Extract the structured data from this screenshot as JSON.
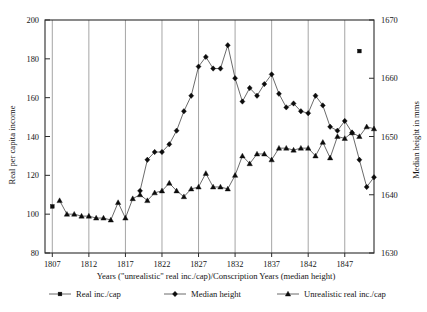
{
  "figure": {
    "background_color": "#ffffff",
    "frame_color": "#2b2b2b",
    "gridline_color": "#8e8e8e",
    "marker_color": "#0c0c0c"
  },
  "axes": {
    "left": {
      "title": "Real per capita income",
      "ticks": [
        "80",
        "100",
        "120",
        "140",
        "160",
        "180",
        "200"
      ],
      "min": 80,
      "max": 200
    },
    "right": {
      "title": "Median height in mms",
      "ticks": [
        "1630",
        "1640",
        "1650",
        "1660",
        "1670"
      ],
      "min": 1630,
      "max": 1670
    },
    "bottom": {
      "title": "Years (\"unrealistic\" real inc./cap)/Conscription Years (median height)",
      "ticks": [
        "1807",
        "1812",
        "1817",
        "1822",
        "1827",
        "1832",
        "1837",
        "1842",
        "1847"
      ],
      "min": 1806,
      "max": 1851
    }
  },
  "legend": {
    "items": [
      {
        "label": "Real inc./cap",
        "marker": "square-marker"
      },
      {
        "label": "Median height",
        "marker": "diamond-marker"
      },
      {
        "label": "Unrealistic real inc./cap",
        "marker": "triangle-marker"
      }
    ]
  },
  "chart_data": {
    "type": "line",
    "title": "",
    "subtitle": "",
    "xlabel": "Years (\"unrealistic\" real inc./cap)/Conscription Years (median height)",
    "ylabel": "Real per capita income",
    "ylabel_right": "Median height in mms",
    "xlim": [
      1806,
      1851
    ],
    "ylim": [
      80,
      200
    ],
    "ylim_right": [
      1630,
      1670
    ],
    "grid": "vertical-major-only",
    "legend_position": "below-axes",
    "series": [
      {
        "name": "Real inc./cap",
        "marker": "square",
        "axis": "left",
        "connected": false,
        "points": [
          {
            "x": 1807,
            "y": 104
          },
          {
            "x": 1849,
            "y": 184
          }
        ]
      },
      {
        "name": "Median height",
        "marker": "diamond",
        "axis": "left",
        "connected": true,
        "points": [
          {
            "x": 1819,
            "y": 112
          },
          {
            "x": 1820,
            "y": 128
          },
          {
            "x": 1821,
            "y": 132
          },
          {
            "x": 1822,
            "y": 132
          },
          {
            "x": 1823,
            "y": 136
          },
          {
            "x": 1824,
            "y": 143
          },
          {
            "x": 1825,
            "y": 153
          },
          {
            "x": 1826,
            "y": 161
          },
          {
            "x": 1827,
            "y": 176
          },
          {
            "x": 1828,
            "y": 181
          },
          {
            "x": 1829,
            "y": 175
          },
          {
            "x": 1830,
            "y": 175
          },
          {
            "x": 1831,
            "y": 187
          },
          {
            "x": 1832,
            "y": 170
          },
          {
            "x": 1833,
            "y": 158
          },
          {
            "x": 1834,
            "y": 165
          },
          {
            "x": 1835,
            "y": 161
          },
          {
            "x": 1836,
            "y": 167
          },
          {
            "x": 1837,
            "y": 172
          },
          {
            "x": 1838,
            "y": 162
          },
          {
            "x": 1839,
            "y": 155
          },
          {
            "x": 1840,
            "y": 157
          },
          {
            "x": 1841,
            "y": 153
          },
          {
            "x": 1842,
            "y": 152
          },
          {
            "x": 1843,
            "y": 161
          },
          {
            "x": 1844,
            "y": 156
          },
          {
            "x": 1845,
            "y": 145
          },
          {
            "x": 1846,
            "y": 143
          },
          {
            "x": 1847,
            "y": 148
          },
          {
            "x": 1848,
            "y": 142
          },
          {
            "x": 1849,
            "y": 128
          },
          {
            "x": 1850,
            "y": 114
          },
          {
            "x": 1851,
            "y": 119
          }
        ]
      },
      {
        "name": "Unrealistic real inc./cap",
        "marker": "triangle",
        "axis": "left",
        "connected": true,
        "points": [
          {
            "x": 1808,
            "y": 107
          },
          {
            "x": 1809,
            "y": 100
          },
          {
            "x": 1810,
            "y": 100
          },
          {
            "x": 1811,
            "y": 99
          },
          {
            "x": 1812,
            "y": 99
          },
          {
            "x": 1813,
            "y": 98
          },
          {
            "x": 1814,
            "y": 98
          },
          {
            "x": 1815,
            "y": 97
          },
          {
            "x": 1816,
            "y": 106
          },
          {
            "x": 1817,
            "y": 98
          },
          {
            "x": 1818,
            "y": 108
          },
          {
            "x": 1819,
            "y": 110
          },
          {
            "x": 1820,
            "y": 107
          },
          {
            "x": 1821,
            "y": 111
          },
          {
            "x": 1822,
            "y": 112
          },
          {
            "x": 1823,
            "y": 116
          },
          {
            "x": 1824,
            "y": 112
          },
          {
            "x": 1825,
            "y": 109
          },
          {
            "x": 1826,
            "y": 113
          },
          {
            "x": 1827,
            "y": 114
          },
          {
            "x": 1828,
            "y": 121
          },
          {
            "x": 1829,
            "y": 114
          },
          {
            "x": 1830,
            "y": 114
          },
          {
            "x": 1831,
            "y": 113
          },
          {
            "x": 1832,
            "y": 120
          },
          {
            "x": 1833,
            "y": 130
          },
          {
            "x": 1834,
            "y": 126
          },
          {
            "x": 1835,
            "y": 131
          },
          {
            "x": 1836,
            "y": 131
          },
          {
            "x": 1837,
            "y": 128
          },
          {
            "x": 1838,
            "y": 134
          },
          {
            "x": 1839,
            "y": 134
          },
          {
            "x": 1840,
            "y": 133
          },
          {
            "x": 1841,
            "y": 134
          },
          {
            "x": 1842,
            "y": 134
          },
          {
            "x": 1843,
            "y": 130
          },
          {
            "x": 1844,
            "y": 137
          },
          {
            "x": 1845,
            "y": 129
          },
          {
            "x": 1846,
            "y": 140
          },
          {
            "x": 1847,
            "y": 139
          },
          {
            "x": 1848,
            "y": 142
          },
          {
            "x": 1849,
            "y": 140
          },
          {
            "x": 1850,
            "y": 145
          },
          {
            "x": 1851,
            "y": 144
          }
        ]
      }
    ]
  }
}
